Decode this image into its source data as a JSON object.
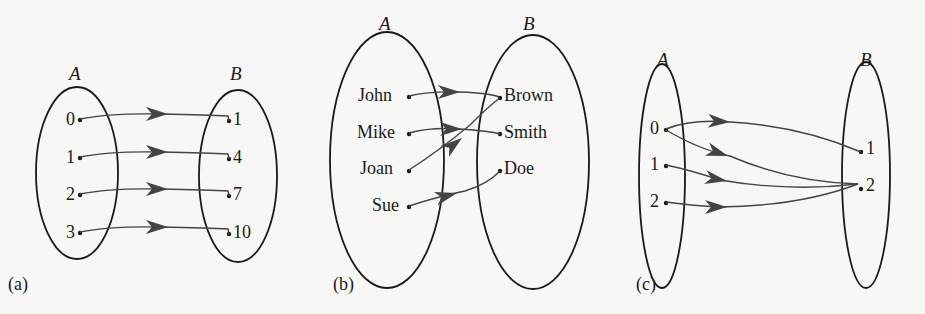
{
  "figure": {
    "panels": [
      {
        "caption": "(a)",
        "domain_label": "A",
        "codomain_label": "B",
        "domain": [
          "0",
          "1",
          "2",
          "3"
        ],
        "codomain": [
          "1",
          "4",
          "7",
          "10"
        ],
        "mapping": [
          [
            "0",
            "1"
          ],
          [
            "1",
            "4"
          ],
          [
            "2",
            "7"
          ],
          [
            "3",
            "10"
          ]
        ]
      },
      {
        "caption": "(b)",
        "domain_label": "A",
        "codomain_label": "B",
        "domain": [
          "John",
          "Mike",
          "Joan",
          "Sue"
        ],
        "codomain": [
          "Brown",
          "Smith",
          "Doe"
        ],
        "mapping": [
          [
            "John",
            "Brown"
          ],
          [
            "Mike",
            "Smith"
          ],
          [
            "Joan",
            "Brown"
          ],
          [
            "Sue",
            "Doe"
          ]
        ]
      },
      {
        "caption": "(c)",
        "domain_label": "A",
        "codomain_label": "B",
        "domain": [
          "0",
          "1",
          "2"
        ],
        "codomain": [
          "1",
          "2"
        ],
        "mapping": [
          [
            "0",
            "1"
          ],
          [
            "0",
            "2"
          ],
          [
            "1",
            "2"
          ],
          [
            "2",
            "2"
          ]
        ]
      }
    ]
  },
  "colors": {
    "ink": "#1a1a1a",
    "arrow": "#444444",
    "background": "#f7f7f5"
  }
}
